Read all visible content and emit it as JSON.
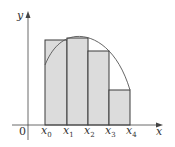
{
  "diagram": {
    "type": "riemann-sum-rectangles",
    "axes": {
      "x_label": "x",
      "y_label": "y",
      "origin_label": "0"
    },
    "partition_labels": [
      {
        "base": "x",
        "sub": "0"
      },
      {
        "base": "x",
        "sub": "1"
      },
      {
        "base": "x",
        "sub": "2"
      },
      {
        "base": "x",
        "sub": "3"
      },
      {
        "base": "x",
        "sub": "4"
      }
    ],
    "rectangles": [
      {
        "x0": 45,
        "x1": 67,
        "top": 40
      },
      {
        "x0": 67,
        "x1": 88,
        "top": 38
      },
      {
        "x0": 88,
        "x1": 109,
        "top": 51
      },
      {
        "x0": 109,
        "x1": 130,
        "top": 90
      }
    ],
    "colors": {
      "rect_fill": "#dcdcdc",
      "rect_stroke": "#3a3a3a",
      "curve": "#555555",
      "axis": "#444444"
    }
  }
}
